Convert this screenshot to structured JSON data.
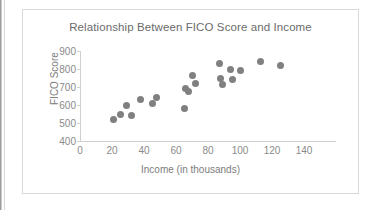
{
  "chart_data": {
    "type": "scatter",
    "title": "Relationship Between FICO Score and Income",
    "xlabel": "Income (in thousands)",
    "ylabel": "FICO Score",
    "xlim": [
      0,
      140
    ],
    "ylim": [
      400,
      900
    ],
    "xticks": [
      0,
      20,
      40,
      60,
      80,
      100,
      120,
      140
    ],
    "yticks": [
      400,
      500,
      600,
      700,
      800,
      900
    ],
    "grid": false,
    "legend": false,
    "marker_color": "#808080",
    "series": [
      {
        "name": "FICO Score vs Income",
        "points": [
          [
            21,
            522
          ],
          [
            25,
            547
          ],
          [
            29,
            595
          ],
          [
            32,
            542
          ],
          [
            38,
            632
          ],
          [
            45,
            606
          ],
          [
            48,
            640
          ],
          [
            65,
            582
          ],
          [
            66,
            693
          ],
          [
            68,
            675
          ],
          [
            70,
            766
          ],
          [
            72,
            722
          ],
          [
            87,
            833
          ],
          [
            88,
            745
          ],
          [
            89,
            712
          ],
          [
            94,
            800
          ],
          [
            95,
            740
          ],
          [
            100,
            790
          ],
          [
            113,
            840
          ],
          [
            125,
            820
          ]
        ]
      }
    ]
  },
  "axis_titles": {
    "y": "FICO Score",
    "x": "Income (in thousands)"
  }
}
